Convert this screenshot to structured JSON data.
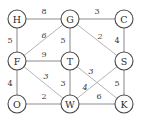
{
  "diagram": {
    "node_radius": 9,
    "colors": {
      "node_fill": "#ffffff",
      "node_stroke": "#4a4a4a",
      "edge": "#8d8d8d",
      "diagonal_edge": "#a8a8a8",
      "label_text": "#2b2b2b",
      "weight_text": "#3a3a3a",
      "background": "#ffffff"
    },
    "nodes": [
      {
        "id": "H",
        "label": "H",
        "x": 17,
        "y": 19
      },
      {
        "id": "G",
        "label": "G",
        "x": 70,
        "y": 19
      },
      {
        "id": "C",
        "label": "C",
        "x": 124,
        "y": 19
      },
      {
        "id": "F",
        "label": "F",
        "x": 17,
        "y": 61
      },
      {
        "id": "T",
        "label": "T",
        "x": 70,
        "y": 61
      },
      {
        "id": "S",
        "label": "S",
        "x": 124,
        "y": 61
      },
      {
        "id": "O",
        "label": "O",
        "x": 17,
        "y": 104
      },
      {
        "id": "W",
        "label": "W",
        "x": 70,
        "y": 104
      },
      {
        "id": "K",
        "label": "K",
        "x": 124,
        "y": 104
      }
    ],
    "edges": [
      {
        "from": "H",
        "to": "G",
        "weight": "8",
        "lx": 44,
        "ly": 11,
        "kind": "straight"
      },
      {
        "from": "G",
        "to": "C",
        "weight": "3",
        "lx": 97,
        "ly": 11,
        "kind": "straight"
      },
      {
        "from": "H",
        "to": "F",
        "weight": "5",
        "lx": 10,
        "ly": 40,
        "kind": "straight"
      },
      {
        "from": "F",
        "to": "G",
        "weight": "6",
        "lx": 44,
        "ly": 35,
        "kind": "diagonal"
      },
      {
        "from": "G",
        "to": "T",
        "weight": "5",
        "lx": 63,
        "ly": 40,
        "kind": "straight"
      },
      {
        "from": "G",
        "to": "S",
        "weight": "2",
        "lx": 100,
        "ly": 36,
        "kind": "diagonal"
      },
      {
        "from": "C",
        "to": "S",
        "weight": "4",
        "lx": 117,
        "ly": 40,
        "kind": "straight"
      },
      {
        "from": "F",
        "to": "T",
        "weight": "9",
        "lx": 44,
        "ly": 54,
        "kind": "straight"
      },
      {
        "from": "F",
        "to": "O",
        "weight": "4",
        "lx": 10,
        "ly": 83,
        "kind": "straight"
      },
      {
        "from": "F",
        "to": "W",
        "weight": "3",
        "lx": 46,
        "ly": 76,
        "kind": "diagonal"
      },
      {
        "from": "T",
        "to": "W",
        "weight": "3",
        "lx": 63,
        "ly": 83,
        "kind": "straight"
      },
      {
        "from": "T",
        "to": "K",
        "weight": "4",
        "lx": 85,
        "ly": 87,
        "kind": "diagonal"
      },
      {
        "from": "W",
        "to": "S",
        "weight": "3",
        "lx": 91,
        "ly": 71,
        "kind": "diagonal"
      },
      {
        "from": "S",
        "to": "K",
        "weight": "5",
        "lx": 117,
        "ly": 83,
        "kind": "straight"
      },
      {
        "from": "O",
        "to": "W",
        "weight": "2",
        "lx": 44,
        "ly": 96,
        "kind": "straight"
      },
      {
        "from": "W",
        "to": "K",
        "weight": "6",
        "lx": 99,
        "ly": 96,
        "kind": "straight"
      }
    ]
  }
}
